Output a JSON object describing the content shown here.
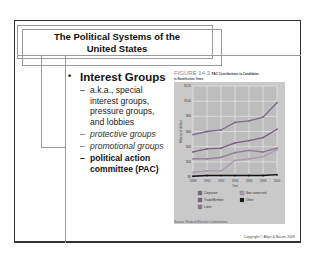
{
  "slide": {
    "title": "The Political Systems of the United States",
    "title_line1": "The Political Systems of the",
    "title_line2": "United States",
    "bullet_main": "Interest Groups",
    "bullet_marker": "•",
    "sub_marker": "–",
    "sub_items": [
      {
        "text_line1": "a.k.a., special",
        "text_line2": "interest groups,",
        "text_line3": "pressure groups,",
        "text_line4": "and lobbies",
        "style": "normal"
      },
      {
        "text": "protective groups",
        "style": "italic"
      },
      {
        "text": "promotional groups",
        "style": "italic"
      },
      {
        "text_line1": "political action",
        "text_line2": "committee (PAC)",
        "style": "bold"
      }
    ],
    "copyright": "Copyright © Allyn & Bacon 2009"
  },
  "figure": {
    "label": "FIGURE 14.3",
    "title": "PAC Contributions to Candidates",
    "subtitle": "in Nonelection Years",
    "source": "Source: Federal Election Commission."
  },
  "chart_data": {
    "type": "line",
    "title": "PAC Contributions to Candidates in Nonelection Years",
    "xlabel": "Year",
    "ylabel": "Millions of dollars",
    "x": [
      1988,
      1990,
      1992,
      1994,
      1996,
      1998,
      2000
    ],
    "ylim": [
      0,
      120
    ],
    "yticks": [
      0,
      20,
      40,
      60,
      80,
      100,
      120
    ],
    "grid": true,
    "legend_position": "bottom",
    "series": [
      {
        "name": "Corporate",
        "color": "#7a6a8a",
        "values": [
          56,
          60,
          62,
          72,
          74,
          79,
          98
        ]
      },
      {
        "name": "Trade/Member",
        "color": "#7a5f80",
        "values": [
          33,
          37,
          38,
          45,
          48,
          52,
          63
        ]
      },
      {
        "name": "Labor",
        "color": "#8a7a95",
        "values": [
          24,
          24,
          26,
          32,
          35,
          33,
          38
        ]
      },
      {
        "name": "Non-connected",
        "color": "#a899ae",
        "values": [
          6,
          8,
          8,
          22,
          24,
          27,
          36
        ]
      },
      {
        "name": "Other",
        "color": "#111111",
        "values": [
          1,
          2,
          2,
          2,
          2,
          2,
          3
        ]
      }
    ]
  }
}
